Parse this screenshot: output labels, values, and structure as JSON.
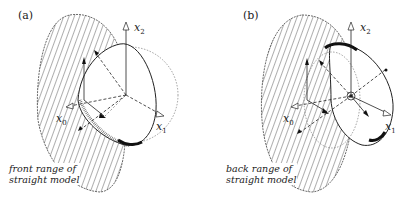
{
  "panels": [
    {
      "label": "(a)",
      "axes": {
        "x0": "x",
        "x0_sub": "0",
        "x1": "x",
        "x1_sub": "1",
        "x2": "x",
        "x2_sub": "2"
      },
      "caption_line1": "front range of",
      "caption_line2": "straight model"
    },
    {
      "label": "(b)",
      "axes": {
        "x0": "x",
        "x0_sub": "0",
        "x1": "x",
        "x1_sub": "1",
        "x2": "x",
        "x2_sub": "2"
      },
      "caption_line1": "back range of",
      "caption_line2": "straight model"
    }
  ],
  "colors": {
    "ink": "#222222",
    "background": "#ffffff",
    "dotted": "#666666"
  }
}
